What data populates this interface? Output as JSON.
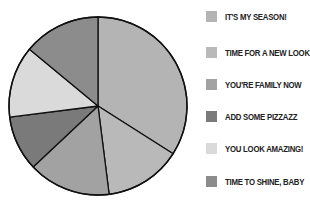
{
  "chart_data": {
    "type": "pie",
    "title": "",
    "categories": [
      "IT'S MY SEASON!",
      "TIME FOR A NEW LOOK",
      "YOU'RE FAMILY NOW",
      "ADD SOME PIZZAZZ",
      "YOU LOOK AMAZING!",
      "TIME TO SHINE, BABY"
    ],
    "values": [
      34,
      14,
      15,
      10,
      13,
      14
    ],
    "slice_order_clockwise_from_top": [
      "IT'S MY SEASON!",
      "TIME FOR A NEW LOOK",
      "YOU'RE FAMILY NOW",
      "ADD SOME PIZZAZZ",
      "YOU LOOK AMAZING!",
      "TIME TO SHINE, BABY"
    ],
    "colors": [
      "#b4b4b4",
      "#b9b9b9",
      "#a2a2a2",
      "#7a7a7a",
      "#dadada",
      "#8c8c8c"
    ],
    "legend_position": "right",
    "start_angle": "12 o'clock",
    "direction": "clockwise"
  },
  "legend": {
    "items": [
      {
        "label": "IT'S MY SEASON!",
        "color": "#b4b4b4"
      },
      {
        "label": "TIME FOR A NEW LOOK",
        "color": "#b9b9b9"
      },
      {
        "label": "YOU'RE FAMILY NOW",
        "color": "#a2a2a2"
      },
      {
        "label": "ADD SOME PIZZAZZ",
        "color": "#7a7a7a"
      },
      {
        "label": "YOU LOOK AMAZING!",
        "color": "#dadada"
      },
      {
        "label": "TIME TO SHINE, BABY",
        "color": "#8c8c8c"
      }
    ]
  }
}
